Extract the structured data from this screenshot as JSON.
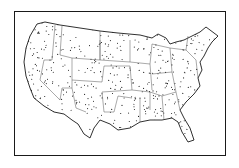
{
  "map": {
    "subject": "contiguous-united-states",
    "style": "stippled-dot-map",
    "colors": {
      "background": "#ffffff",
      "ink": "#1a1a1a"
    },
    "outline": "M37,24 L45,22 L60,25 L80,28 L100,31 L118,33 L140,35 L152,38 L158,34 L166,38 L170,44 L176,42 L184,40 L192,36 L200,32 L206,27 L210,30 L218,36 L212,42 L208,48 L204,56 L200,62 L202,70 L198,78 L200,86 L194,94 L186,102 L180,110 L184,118 L190,128 L194,140 L188,142 L182,132 L178,122 L172,118 L162,120 L150,120 L140,122 L130,128 L118,130 L110,124 L100,120 L94,128 L90,138 L84,134 L78,124 L72,120 L64,114 L54,112 L44,106 L34,98 L30,88 L26,76 L24,62 L26,48 L30,36 Z",
    "borders": [
      "M55,25 L52,60 L44,60",
      "M62,26 L60,55 L72,58 L72,80",
      "M44,60 L40,80 L60,100",
      "M72,58 L100,60 L100,40",
      "M100,31 L100,60",
      "M72,80 L102,82 L104,66 L130,66",
      "M100,60 L130,62 L130,40",
      "M130,66 L132,90 L102,92",
      "M60,100 L62,88 L72,88 L72,80",
      "M72,88 L76,108 L86,112",
      "M102,92 L104,112 L114,112",
      "M132,90 L150,92 L150,110",
      "M130,62 L150,64 L152,44",
      "M150,64 L152,90",
      "M152,44 L170,48 L172,72 L152,74",
      "M172,72 L176,92 L162,96 L150,92",
      "M176,92 L180,110",
      "M162,96 L164,120",
      "M170,48 L186,50 L196,60",
      "M186,50 L188,36",
      "M196,60 L198,78",
      "M114,112 L118,96 L132,98",
      "M140,98 L140,122"
    ],
    "dot_count": 600,
    "dot_seed": 7
  }
}
